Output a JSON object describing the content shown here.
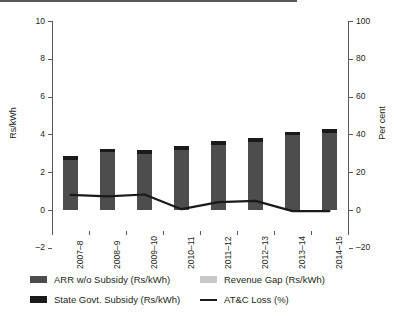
{
  "chart_data": {
    "type": "bar",
    "title": "",
    "xlabel": "",
    "ylabel": "Rs/kWh",
    "ylabel_secondary": "Per cent",
    "categories": [
      "2007–8",
      "2008–9",
      "2009–10",
      "2010–11",
      "2011–12",
      "2012–13",
      "2013–14",
      "2014–15"
    ],
    "ylim": [
      -2,
      10
    ],
    "yticks": [
      "10",
      "8",
      "6",
      "4",
      "2",
      "0",
      "–2"
    ],
    "ytick_values": [
      10,
      8,
      6,
      4,
      2,
      0,
      -2
    ],
    "ylim_secondary": [
      -20,
      100
    ],
    "yticks_secondary": [
      "100",
      "80",
      "60",
      "40",
      "20",
      "0",
      "–20"
    ],
    "ytick_values_secondary": [
      100,
      80,
      60,
      40,
      20,
      0,
      -20
    ],
    "grid": false,
    "legend_position": "bottom",
    "series": [
      {
        "name": "ARR w/o Subsidy (Rs/kWh)",
        "type": "bar",
        "stack": "cost",
        "axis": "left",
        "color": "#4d4d4d",
        "values": [
          2.65,
          3.05,
          2.95,
          3.2,
          3.45,
          3.6,
          3.95,
          4.1
        ]
      },
      {
        "name": "State Govt. Subsidy (Rs/kWh)",
        "type": "bar",
        "stack": "cost",
        "axis": "left",
        "color": "#1a1a1a",
        "values": [
          0.2,
          0.2,
          0.2,
          0.2,
          0.2,
          0.2,
          0.2,
          0.2
        ]
      },
      {
        "name": "Revenue Gap (Rs/kWh)",
        "type": "bar",
        "stack": "cost",
        "axis": "left",
        "color": "#c8c8c8",
        "values": [
          0,
          0,
          0,
          0,
          0,
          0,
          0,
          0
        ]
      },
      {
        "name": "AT&C Loss (%)",
        "type": "line",
        "axis": "right",
        "color": "#1a1a1a",
        "values": [
          8.0,
          7.2,
          8.2,
          0.4,
          4.2,
          4.8,
          -0.6,
          -0.6
        ]
      }
    ],
    "bar_totals": [
      2.85,
      3.25,
      3.15,
      3.4,
      3.65,
      3.8,
      4.15,
      4.3
    ]
  },
  "legend": {
    "items": [
      {
        "label": "ARR w/o Subsidy (Rs/kWh)",
        "swatch": "#4d4d4d",
        "kind": "swatch"
      },
      {
        "label": "State Govt. Subsidy (Rs/kWh)",
        "swatch": "#1a1a1a",
        "kind": "swatch"
      },
      {
        "label": "Revenue Gap (Rs/kWh)",
        "swatch": "#c8c8c8",
        "kind": "swatch"
      },
      {
        "label": "AT&C Loss (%)",
        "swatch": "#1a1a1a",
        "kind": "line"
      }
    ]
  }
}
